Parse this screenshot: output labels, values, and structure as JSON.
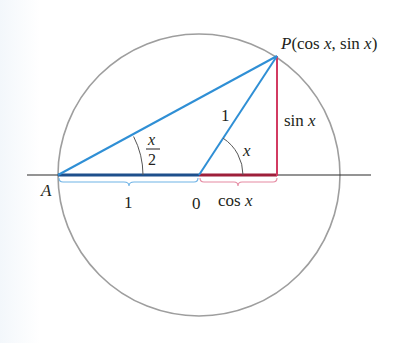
{
  "diagram": {
    "title": "",
    "colors": {
      "circle": "#9e9e9e",
      "axis": "#2b2b2b",
      "blue_line": "#2f8fd5",
      "blue_base": "#1d4f8c",
      "blue_brace": "#6fb3e6",
      "red_line": "#d23b62",
      "red_base": "#9e1f3a",
      "red_brace": "#e58aa2",
      "arc": "#555555",
      "text": "#231f20"
    },
    "points": {
      "A": {
        "label": "A",
        "x": 58,
        "y": 175
      },
      "O": {
        "label": "0",
        "x": 199,
        "y": 175
      },
      "P": {
        "label_prefix": "P",
        "label_rest": "(cos ",
        "label_x1": "x",
        "label_sep": ", sin ",
        "label_x2": "x",
        "label_close": ")",
        "x": 277,
        "y": 56
      },
      "F": {
        "x": 277,
        "y": 175
      }
    },
    "circle": {
      "cx": 199,
      "cy": 175,
      "r": 141
    },
    "labels": {
      "A": "A",
      "origin": "0",
      "radius": "1",
      "base_length": "1",
      "sin": "sin ",
      "sin_var": "x",
      "cos": "cos ",
      "cos_var": "x",
      "angle_x": "x",
      "half_angle_num": "x",
      "half_angle_den": "2"
    }
  }
}
